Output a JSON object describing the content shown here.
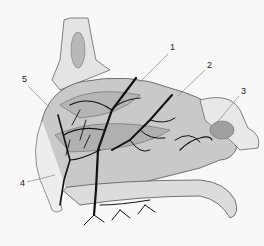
{
  "figure": {
    "labels": [
      {
        "id": "1",
        "text": "1",
        "x": 170,
        "y": 48
      },
      {
        "id": "2",
        "text": "2",
        "x": 207,
        "y": 65
      },
      {
        "id": "3",
        "text": "3",
        "x": 241,
        "y": 91
      },
      {
        "id": "4",
        "text": "4",
        "x": 21,
        "y": 183
      },
      {
        "id": "5",
        "text": "5",
        "x": 23,
        "y": 79
      }
    ],
    "colors": {
      "background": "#f8f8f8",
      "tissue_fill": "#c9c9c9",
      "tissue_dark": "#a8a8a8",
      "vessels": "#111111",
      "outline": "#555555",
      "leader": "#888888"
    }
  }
}
